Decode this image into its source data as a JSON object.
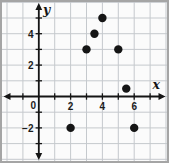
{
  "chart_data": {
    "type": "scatter",
    "points": [
      {
        "x": 2,
        "y": -2
      },
      {
        "x": 3,
        "y": 3
      },
      {
        "x": 3.5,
        "y": 4
      },
      {
        "x": 4,
        "y": 5
      },
      {
        "x": 5,
        "y": 3
      },
      {
        "x": 5.5,
        "y": 0.5
      },
      {
        "x": 6,
        "y": -2
      }
    ],
    "xlabel": "x",
    "ylabel": "y",
    "x_tick_labels": [
      {
        "value": 2,
        "label": "2"
      },
      {
        "value": 4,
        "label": "4"
      },
      {
        "value": 6,
        "label": "6"
      }
    ],
    "y_tick_labels": [
      {
        "value": 4,
        "label": "4"
      },
      {
        "value": 2,
        "label": "2"
      },
      {
        "value": -2,
        "label": "−2"
      }
    ],
    "origin_label": "0",
    "xlim": [
      -2.3,
      8.2
    ],
    "ylim": [
      -4.3,
      6.2
    ],
    "grid": true,
    "legend": "none",
    "colors": {
      "points": "#151515",
      "axes": "#151515",
      "grid": "#c5c9cd",
      "background": "#fbfbfb",
      "border": "#a5a5a5",
      "labels": "#1c1c1c"
    }
  }
}
